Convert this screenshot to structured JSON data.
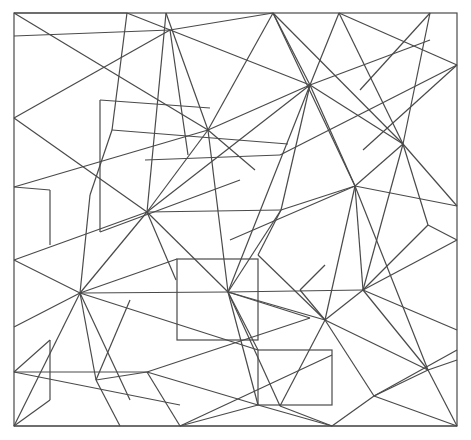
{
  "diagram": {
    "type": "line-drawing",
    "stroke_color": "#4a4a4a",
    "background": "#ffffff",
    "frame": {
      "x": 14,
      "y": 13,
      "width": 443,
      "height": 413
    },
    "rectangles": [
      {
        "x": 177,
        "y": 259,
        "width": 81,
        "height": 81
      },
      {
        "x": 258,
        "y": 350,
        "width": 74,
        "height": 55
      }
    ],
    "segments": [
      [
        14,
        13,
        127,
        13
      ],
      [
        14,
        36,
        170,
        30
      ],
      [
        14,
        13,
        208,
        130
      ],
      [
        127,
        13,
        112,
        130
      ],
      [
        14,
        118,
        170,
        30
      ],
      [
        14,
        118,
        147,
        212
      ],
      [
        14,
        187,
        50,
        190
      ],
      [
        50,
        190,
        50,
        245
      ],
      [
        14,
        187,
        208,
        130
      ],
      [
        14,
        260,
        147,
        212
      ],
      [
        14,
        260,
        80,
        293
      ],
      [
        14,
        327,
        80,
        293
      ],
      [
        14,
        372,
        50,
        340
      ],
      [
        50,
        340,
        50,
        400
      ],
      [
        14,
        426,
        80,
        293
      ],
      [
        14,
        372,
        147,
        372
      ],
      [
        14,
        372,
        180,
        405
      ],
      [
        14,
        426,
        50,
        400
      ],
      [
        127,
        13,
        310,
        85
      ],
      [
        166,
        13,
        208,
        130
      ],
      [
        166,
        13,
        147,
        212
      ],
      [
        170,
        30,
        188,
        155
      ],
      [
        170,
        30,
        273,
        13
      ],
      [
        208,
        130,
        310,
        85
      ],
      [
        208,
        130,
        273,
        13
      ],
      [
        208,
        130,
        255,
        170
      ],
      [
        208,
        130,
        228,
        292
      ],
      [
        208,
        130,
        147,
        212
      ],
      [
        100,
        100,
        210,
        108
      ],
      [
        100,
        100,
        100,
        232
      ],
      [
        100,
        232,
        240,
        180
      ],
      [
        145,
        160,
        280,
        155
      ],
      [
        112,
        130,
        90,
        195
      ],
      [
        90,
        195,
        80,
        293
      ],
      [
        112,
        130,
        288,
        144
      ],
      [
        147,
        212,
        228,
        292
      ],
      [
        147,
        212,
        310,
        85
      ],
      [
        147,
        212,
        281,
        210
      ],
      [
        147,
        212,
        176,
        280
      ],
      [
        147,
        212,
        80,
        293
      ],
      [
        80,
        293,
        228,
        292
      ],
      [
        80,
        293,
        96,
        380
      ],
      [
        80,
        293,
        130,
        400
      ],
      [
        80,
        293,
        177,
        259
      ],
      [
        80,
        293,
        258,
        350
      ],
      [
        96,
        380,
        120,
        426
      ],
      [
        96,
        380,
        147,
        372
      ],
      [
        147,
        372,
        310,
        318
      ],
      [
        147,
        372,
        258,
        405
      ],
      [
        147,
        372,
        180,
        426
      ],
      [
        180,
        426,
        332,
        355
      ],
      [
        180,
        426,
        258,
        405
      ],
      [
        96,
        380,
        130,
        300
      ],
      [
        273,
        13,
        310,
        85
      ],
      [
        273,
        13,
        355,
        186
      ],
      [
        273,
        13,
        403,
        144
      ],
      [
        339,
        13,
        310,
        85
      ],
      [
        339,
        13,
        403,
        144
      ],
      [
        339,
        13,
        457,
        65
      ],
      [
        430,
        13,
        360,
        90
      ],
      [
        430,
        13,
        403,
        144
      ],
      [
        457,
        65,
        363,
        150
      ],
      [
        457,
        65,
        280,
        155
      ],
      [
        310,
        85,
        228,
        292
      ],
      [
        310,
        85,
        281,
        210
      ],
      [
        310,
        85,
        355,
        186
      ],
      [
        310,
        85,
        403,
        144
      ],
      [
        310,
        85,
        430,
        40
      ],
      [
        403,
        144,
        457,
        206
      ],
      [
        403,
        144,
        355,
        186
      ],
      [
        403,
        144,
        363,
        290
      ],
      [
        403,
        144,
        428,
        225
      ],
      [
        428,
        225,
        457,
        240
      ],
      [
        355,
        186,
        281,
        210
      ],
      [
        355,
        186,
        363,
        290
      ],
      [
        355,
        186,
        230,
        240
      ],
      [
        355,
        186,
        325,
        320
      ],
      [
        355,
        186,
        428,
        370
      ],
      [
        355,
        186,
        457,
        206
      ],
      [
        281,
        210,
        228,
        292
      ],
      [
        281,
        210,
        258,
        255
      ],
      [
        258,
        255,
        325,
        320
      ],
      [
        228,
        292,
        325,
        320
      ],
      [
        228,
        292,
        310,
        318
      ],
      [
        228,
        292,
        280,
        406
      ],
      [
        228,
        292,
        363,
        290
      ],
      [
        228,
        292,
        258,
        350
      ],
      [
        228,
        292,
        258,
        405
      ],
      [
        300,
        290,
        325,
        265
      ],
      [
        300,
        290,
        325,
        320
      ],
      [
        325,
        320,
        363,
        290
      ],
      [
        325,
        320,
        374,
        396
      ],
      [
        325,
        320,
        428,
        370
      ],
      [
        325,
        320,
        280,
        406
      ],
      [
        363,
        290,
        428,
        225
      ],
      [
        363,
        290,
        457,
        240
      ],
      [
        363,
        290,
        428,
        370
      ],
      [
        363,
        290,
        457,
        330
      ],
      [
        428,
        370,
        457,
        360
      ],
      [
        428,
        370,
        374,
        396
      ],
      [
        428,
        370,
        457,
        426
      ],
      [
        374,
        396,
        457,
        426
      ],
      [
        374,
        396,
        332,
        426
      ],
      [
        457,
        350,
        374,
        396
      ],
      [
        280,
        406,
        332,
        426
      ],
      [
        258,
        405,
        332,
        426
      ],
      [
        14,
        426,
        457,
        426
      ]
    ]
  }
}
